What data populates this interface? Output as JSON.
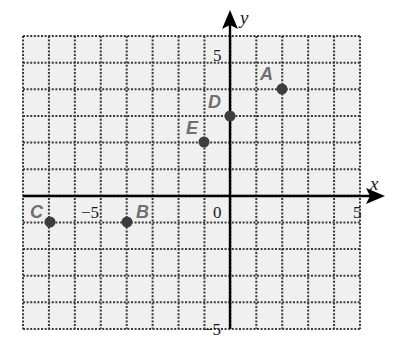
{
  "chart_data": {
    "type": "scatter",
    "title": "",
    "xlabel": "x",
    "ylabel": "y",
    "xlim": [
      -8,
      5
    ],
    "ylim": [
      -5,
      6
    ],
    "grid": true,
    "grid_style": "dotted",
    "tick_labels": {
      "x": [
        {
          "value": -5,
          "label": "−5"
        },
        {
          "value": 0,
          "label": "0"
        },
        {
          "value": 5,
          "label": "5"
        }
      ],
      "y": [
        {
          "value": 5,
          "label": "5"
        },
        {
          "value": -5,
          "label": "−5"
        }
      ]
    },
    "points": [
      {
        "label": "A",
        "x": 2,
        "y": 4
      },
      {
        "label": "B",
        "x": -4,
        "y": -1
      },
      {
        "label": "C",
        "x": -7,
        "y": -1
      },
      {
        "label": "D",
        "x": 0,
        "y": 3
      },
      {
        "label": "E",
        "x": -1,
        "y": 2
      }
    ]
  },
  "colors": {
    "grid_background": "#f0f0f0",
    "grid_line": "#3a3a3a",
    "axis": "#000000",
    "point": "#3d3d3d",
    "point_label": "#707070"
  },
  "labels": {
    "x_axis": "x",
    "y_axis": "y",
    "x_tick_neg5": "−5",
    "x_tick_0": "0",
    "x_tick_5": "5",
    "y_tick_5": "5",
    "y_tick_neg5": "−5",
    "point_a": "A",
    "point_b": "B",
    "point_c": "C",
    "point_d": "D",
    "point_e": "E"
  }
}
